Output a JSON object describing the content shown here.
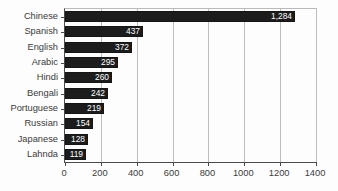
{
  "chart_data": {
    "type": "bar",
    "orientation": "horizontal",
    "title": "",
    "subtitle": "",
    "xlabel": "",
    "ylabel": "",
    "xlim": [
      0,
      1400
    ],
    "ylim": null,
    "grid": "vertical",
    "legend": null,
    "legend_position": "none",
    "bar_color": "#1c1c1c",
    "value_label_color": "#ffffff",
    "axis_color": "#4a4a4a",
    "grid_color": "#bdbdbd",
    "background_color": "#fdfdfd",
    "xticks": [
      0,
      200,
      400,
      600,
      800,
      1000,
      1200,
      1400
    ],
    "xtick_labels": [
      "0",
      "200",
      "400",
      "600",
      "800",
      "1000",
      "1200",
      "1400"
    ],
    "categories": [
      "Chinese",
      "Spanish",
      "English",
      "Arabic",
      "Hindi",
      "Bengali",
      "Portuguese",
      "Russian",
      "Japanese",
      "Lahnda"
    ],
    "values": [
      1284,
      437,
      372,
      295,
      260,
      242,
      219,
      154,
      128,
      119
    ],
    "value_labels": [
      "1,284",
      "437",
      "372",
      "295",
      "260",
      "242",
      "219",
      "154",
      "128",
      "119"
    ],
    "bars": [
      {
        "category": "Chinese",
        "value": 1284,
        "label": "1,284"
      },
      {
        "category": "Spanish",
        "value": 437,
        "label": "437"
      },
      {
        "category": "English",
        "value": 372,
        "label": "372"
      },
      {
        "category": "Arabic",
        "value": 295,
        "label": "295"
      },
      {
        "category": "Hindi",
        "value": 260,
        "label": "260"
      },
      {
        "category": "Bengali",
        "value": 242,
        "label": "242"
      },
      {
        "category": "Portuguese",
        "value": 219,
        "label": "219"
      },
      {
        "category": "Russian",
        "value": 154,
        "label": "154"
      },
      {
        "category": "Japanese",
        "value": 128,
        "label": "128"
      },
      {
        "category": "Lahnda",
        "value": 119,
        "label": "119"
      }
    ]
  }
}
